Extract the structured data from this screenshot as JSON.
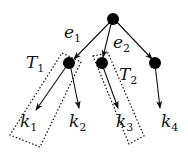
{
  "diagram": {
    "type": "tree",
    "nodes": [
      {
        "id": "root"
      },
      {
        "id": "n1"
      },
      {
        "id": "n2"
      },
      {
        "id": "n3"
      }
    ],
    "edge_labels": [
      {
        "base": "e",
        "sub": "1"
      },
      {
        "base": "e",
        "sub": "2"
      }
    ],
    "subtree_labels": [
      {
        "base": "T",
        "sub": "1"
      },
      {
        "base": "T",
        "sub": "2"
      }
    ],
    "leaves": [
      {
        "base": "k",
        "sub": "1"
      },
      {
        "base": "k",
        "sub": "2"
      },
      {
        "base": "k",
        "sub": "3"
      },
      {
        "base": "k",
        "sub": "4"
      }
    ],
    "colors": {
      "node": "#000000",
      "edge": "#111111",
      "box": "#111111"
    }
  }
}
